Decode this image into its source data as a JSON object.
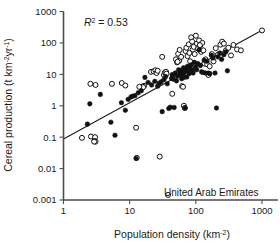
{
  "chart_data": {
    "type": "scatter",
    "title": "",
    "xlabel": "Population density (km⁻²)",
    "ylabel": "Cereal production (t km⁻²yr⁻¹)",
    "xscale": "log",
    "yscale": "log",
    "xlim": [
      1,
      1000
    ],
    "ylim": [
      0.001,
      1000
    ],
    "xticks": [
      1,
      10,
      100,
      1000
    ],
    "xtick_labels": [
      "1",
      "10",
      "100",
      "1000"
    ],
    "yticks": [
      0.001,
      0.01,
      0.1,
      1,
      10,
      100,
      1000
    ],
    "ytick_labels": [
      "0.001",
      "0.01",
      "0.1",
      "1",
      "10",
      "100",
      "1000"
    ],
    "grid": false,
    "legend": null,
    "annotations": [
      {
        "name": "r-squared",
        "text_prefix": "R",
        "text_sup": "2",
        "text_suffix": " = 0.53",
        "x": 3.0,
        "y": 320
      },
      {
        "name": "uae-callout",
        "text": "United Arab Emirates",
        "x": 38,
        "y": 0.00145
      }
    ],
    "fit_line": {
      "name": "regression-line",
      "x": [
        1,
        1000
      ],
      "y": [
        0.088,
        255
      ]
    },
    "series": [
      {
        "name": "open-circles",
        "marker": "open-circle",
        "points": [
          [
            1.9,
            0.095
          ],
          [
            2.6,
            0.105
          ],
          [
            3.0,
            0.1
          ],
          [
            2.95,
            0.075
          ],
          [
            3.05,
            0.072
          ],
          [
            2.55,
            5.0
          ],
          [
            3.05,
            4.6
          ],
          [
            5.4,
            5.0
          ],
          [
            7.6,
            5.3
          ],
          [
            8.6,
            4.4
          ],
          [
            12.5,
            0.2
          ],
          [
            12.8,
            0.022
          ],
          [
            16.5,
            4.3
          ],
          [
            15.6,
            4.1
          ],
          [
            16.0,
            3.9
          ],
          [
            21.0,
            12.0
          ],
          [
            23.0,
            12.5
          ],
          [
            24.5,
            13.5
          ],
          [
            25.5,
            11.0
          ],
          [
            26.5,
            13.0
          ],
          [
            28.5,
            0.024
          ],
          [
            31.0,
            36.0
          ],
          [
            33.0,
            9.5
          ],
          [
            34.0,
            11.5
          ],
          [
            35.5,
            12.0
          ],
          [
            36.0,
            10.5
          ],
          [
            44.0,
            2.4
          ],
          [
            47.0,
            7.8
          ],
          [
            50.0,
            30.0
          ],
          [
            52.0,
            24.0
          ],
          [
            54.0,
            45.0
          ],
          [
            56.0,
            27.0
          ],
          [
            57.0,
            60.0
          ],
          [
            58.0,
            13.0
          ],
          [
            60.0,
            36.0
          ],
          [
            62.0,
            4.2
          ],
          [
            64.0,
            4.0
          ],
          [
            66.0,
            1.0
          ],
          [
            68.0,
            0.85
          ],
          [
            70.0,
            55.0
          ],
          [
            72.0,
            70.0
          ],
          [
            75.0,
            38.0
          ],
          [
            78.0,
            90.0
          ],
          [
            80.0,
            48.0
          ],
          [
            82.0,
            26.0
          ],
          [
            85.0,
            150.0
          ],
          [
            88.0,
            110.0
          ],
          [
            90.0,
            62.0
          ],
          [
            93.0,
            75.0
          ],
          [
            96.0,
            44.0
          ],
          [
            100.0,
            170.0
          ],
          [
            104.0,
            95.0
          ],
          [
            108.0,
            66.0
          ],
          [
            112.0,
            120.0
          ],
          [
            116.0,
            80.0
          ],
          [
            120.0,
            52.0
          ],
          [
            125.0,
            100.0
          ],
          [
            130.0,
            58.0
          ],
          [
            135.0,
            22.0
          ],
          [
            140.0,
            30.0
          ],
          [
            148.0,
            21.0
          ],
          [
            155.0,
            9.5
          ],
          [
            162.0,
            18.0
          ],
          [
            175.0,
            44.0
          ],
          [
            185.0,
            26.0
          ],
          [
            200.0,
            68.0
          ],
          [
            215.0,
            42.0
          ],
          [
            235.0,
            88.0
          ],
          [
            250.0,
            110.0
          ],
          [
            265.0,
            95.0
          ],
          [
            285.0,
            58.0
          ],
          [
            310.0,
            70.0
          ],
          [
            340.0,
            40.0
          ],
          [
            370.0,
            86.0
          ],
          [
            420.0,
            62.0
          ],
          [
            480.0,
            58.0
          ],
          [
            1000.0,
            250.0
          ],
          [
            38.0,
            0.00145
          ],
          [
            2.9,
            0.072
          ],
          [
            14.0,
            4.0
          ],
          [
            53.0,
            25.0
          ],
          [
            115.0,
            85.0
          ]
        ]
      },
      {
        "name": "filled-circles",
        "marker": "filled-circle",
        "points": [
          [
            2.3,
            0.26
          ],
          [
            2.5,
            1.15
          ],
          [
            3.6,
            2.3
          ],
          [
            5.2,
            0.3
          ],
          [
            6.0,
            0.115
          ],
          [
            7.5,
            1.25
          ],
          [
            8.6,
            0.72
          ],
          [
            10.5,
            1.9
          ],
          [
            12.0,
            2.1
          ],
          [
            12.5,
            0.021
          ],
          [
            13.5,
            2.6
          ],
          [
            15.0,
            3.0
          ],
          [
            17.0,
            8.0
          ],
          [
            19.0,
            5.5
          ],
          [
            21.5,
            4.6
          ],
          [
            24.0,
            6.0
          ],
          [
            26.5,
            4.2
          ],
          [
            28.0,
            5.2
          ],
          [
            31.0,
            0.65
          ],
          [
            33.0,
            6.8
          ],
          [
            35.0,
            8.5
          ],
          [
            37.0,
            5.0
          ],
          [
            39.0,
            0.82
          ],
          [
            41.0,
            0.9
          ],
          [
            43.0,
            7.5
          ],
          [
            45.0,
            9.0
          ],
          [
            47.0,
            0.88
          ],
          [
            49.0,
            11.0
          ],
          [
            51.0,
            6.2
          ],
          [
            53.0,
            8.8
          ],
          [
            55.0,
            14.0
          ],
          [
            57.0,
            10.0
          ],
          [
            59.0,
            12.0
          ],
          [
            61.0,
            7.2
          ],
          [
            63.0,
            9.5
          ],
          [
            65.0,
            16.0
          ],
          [
            67.0,
            11.5
          ],
          [
            69.0,
            0.85
          ],
          [
            71.0,
            13.0
          ],
          [
            73.0,
            8.2
          ],
          [
            75.0,
            18.0
          ],
          [
            77.0,
            12.5
          ],
          [
            79.0,
            10.5
          ],
          [
            82.0,
            15.0
          ],
          [
            85.0,
            20.0
          ],
          [
            88.0,
            13.5
          ],
          [
            91.0,
            11.0
          ],
          [
            95.0,
            24.0
          ],
          [
            99.0,
            17.0
          ],
          [
            103.0,
            14.0
          ],
          [
            107.0,
            22.0
          ],
          [
            112.0,
            60.0
          ],
          [
            117.0,
            19.0
          ],
          [
            122.0,
            12.0
          ],
          [
            128.0,
            11.5
          ],
          [
            134.0,
            28.0
          ],
          [
            140.0,
            11.0
          ],
          [
            147.0,
            26.0
          ],
          [
            155.0,
            11.0
          ],
          [
            163.0,
            10.5
          ],
          [
            172.0,
            40.0
          ],
          [
            182.0,
            33.0
          ],
          [
            195.0,
            11.0
          ],
          [
            205.0,
            0.85
          ],
          [
            215.0,
            36.0
          ],
          [
            230.0,
            48.0
          ],
          [
            245.0,
            30.0
          ],
          [
            265.0,
            42.0
          ],
          [
            285.0,
            52.0
          ],
          [
            300.0,
            13.0
          ],
          [
            44.0,
            9.8
          ],
          [
            46.0,
            7.0
          ],
          [
            62.0,
            9.0
          ],
          [
            64.0,
            13.5
          ],
          [
            66.0,
            8.0
          ],
          [
            68.0,
            15.5
          ],
          [
            30.0,
            5.8
          ],
          [
            9.5,
            1.6
          ],
          [
            11.0,
            2.0
          ]
        ]
      }
    ]
  }
}
